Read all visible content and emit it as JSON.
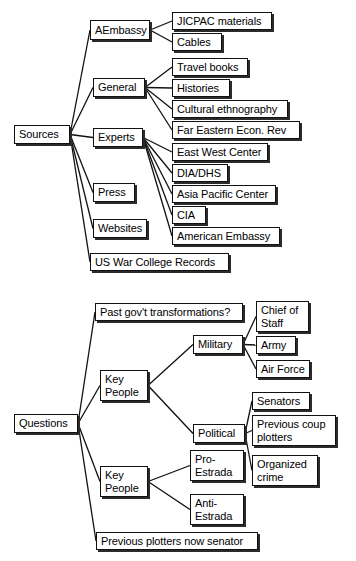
{
  "figure": {
    "diagrams": [
      {
        "id": "sources-map",
        "name": "sources-concept-map",
        "root": "Sources",
        "nodes": [
          {
            "id": "sources",
            "label": "Sources",
            "x": 14,
            "y": 125,
            "w": 56,
            "h": 19
          },
          {
            "id": "aembassy",
            "label": "AEmbassy",
            "x": 90,
            "y": 20,
            "w": 60,
            "h": 20
          },
          {
            "id": "jicpac",
            "label": "JICPAC materials",
            "x": 172,
            "y": 12,
            "w": 100,
            "h": 18
          },
          {
            "id": "cables",
            "label": "Cables",
            "x": 172,
            "y": 33,
            "w": 50,
            "h": 18
          },
          {
            "id": "general",
            "label": "General",
            "x": 93,
            "y": 78,
            "w": 52,
            "h": 19
          },
          {
            "id": "travelbooks",
            "label": "Travel books",
            "x": 172,
            "y": 58,
            "w": 76,
            "h": 18
          },
          {
            "id": "histories",
            "label": "Histories",
            "x": 172,
            "y": 79,
            "w": 58,
            "h": 18
          },
          {
            "id": "cultural",
            "label": "Cultural ethnography",
            "x": 172,
            "y": 100,
            "w": 116,
            "h": 18
          },
          {
            "id": "feer",
            "label": "Far  Eastern Econ. Rev",
            "x": 172,
            "y": 121,
            "w": 128,
            "h": 18
          },
          {
            "id": "experts",
            "label": "Experts",
            "x": 93,
            "y": 128,
            "w": 50,
            "h": 19
          },
          {
            "id": "ewc",
            "label": "East West Center",
            "x": 172,
            "y": 143,
            "w": 96,
            "h": 18
          },
          {
            "id": "diadhs",
            "label": "DIA/DHS",
            "x": 172,
            "y": 164,
            "w": 56,
            "h": 18
          },
          {
            "id": "apc",
            "label": "Asia Pacific Center",
            "x": 172,
            "y": 185,
            "w": 104,
            "h": 18
          },
          {
            "id": "cia",
            "label": "CIA",
            "x": 172,
            "y": 206,
            "w": 34,
            "h": 18
          },
          {
            "id": "amembassy",
            "label": "American Embassy",
            "x": 172,
            "y": 227,
            "w": 108,
            "h": 18
          },
          {
            "id": "press",
            "label": "Press",
            "x": 93,
            "y": 183,
            "w": 42,
            "h": 19
          },
          {
            "id": "websites",
            "label": "Websites",
            "x": 93,
            "y": 219,
            "w": 54,
            "h": 19
          },
          {
            "id": "uswc",
            "label": "US War College Records",
            "x": 90,
            "y": 253,
            "w": 139,
            "h": 18
          }
        ],
        "edges": [
          {
            "from": "sources",
            "to": "aembassy"
          },
          {
            "from": "sources",
            "to": "general"
          },
          {
            "from": "sources",
            "to": "experts"
          },
          {
            "from": "sources",
            "to": "press"
          },
          {
            "from": "sources",
            "to": "websites"
          },
          {
            "from": "sources",
            "to": "uswc"
          },
          {
            "from": "aembassy",
            "to": "jicpac"
          },
          {
            "from": "aembassy",
            "to": "cables"
          },
          {
            "from": "general",
            "to": "travelbooks"
          },
          {
            "from": "general",
            "to": "histories"
          },
          {
            "from": "general",
            "to": "cultural"
          },
          {
            "from": "general",
            "to": "feer"
          },
          {
            "from": "experts",
            "to": "ewc"
          },
          {
            "from": "experts",
            "to": "diadhs"
          },
          {
            "from": "experts",
            "to": "apc"
          },
          {
            "from": "experts",
            "to": "cia"
          },
          {
            "from": "experts",
            "to": "amembassy"
          }
        ]
      },
      {
        "id": "questions-map",
        "name": "questions-concept-map",
        "root": "Questions",
        "nodes": [
          {
            "id": "questions",
            "label": "Questions",
            "x": 14,
            "y": 414,
            "w": 64,
            "h": 19
          },
          {
            "id": "pastgov",
            "label": "Past gov't transformations?",
            "x": 95,
            "y": 303,
            "w": 148,
            "h": 18
          },
          {
            "id": "keypeople1",
            "label": "Key\nPeople",
            "x": 100,
            "y": 370,
            "w": 48,
            "h": 31
          },
          {
            "id": "military",
            "label": "Military",
            "x": 193,
            "y": 335,
            "w": 50,
            "h": 19
          },
          {
            "id": "chiefstaff",
            "label": "Chief of\nStaff",
            "x": 256,
            "y": 301,
            "w": 53,
            "h": 31
          },
          {
            "id": "army",
            "label": "Army",
            "x": 256,
            "y": 336,
            "w": 40,
            "h": 18
          },
          {
            "id": "airforce",
            "label": "Air Force",
            "x": 256,
            "y": 360,
            "w": 54,
            "h": 18
          },
          {
            "id": "political",
            "label": "Political",
            "x": 193,
            "y": 424,
            "w": 52,
            "h": 19
          },
          {
            "id": "senators",
            "label": "Senators",
            "x": 252,
            "y": 392,
            "w": 58,
            "h": 18
          },
          {
            "id": "prevcoup",
            "label": "Previous coup\nplotters",
            "x": 252,
            "y": 415,
            "w": 84,
            "h": 31
          },
          {
            "id": "orgcrime",
            "label": "Organized\ncrime",
            "x": 252,
            "y": 455,
            "w": 66,
            "h": 31
          },
          {
            "id": "keypeople2",
            "label": "Key\nPeople",
            "x": 100,
            "y": 466,
            "w": 48,
            "h": 31
          },
          {
            "id": "proestrada",
            "label": "Pro-\nEstrada",
            "x": 190,
            "y": 450,
            "w": 54,
            "h": 31
          },
          {
            "id": "antiestrada",
            "label": "Anti-\nEstrada",
            "x": 190,
            "y": 494,
            "w": 54,
            "h": 31
          },
          {
            "id": "prevplot",
            "label": "Previous plotters now senator",
            "x": 96,
            "y": 532,
            "w": 162,
            "h": 18
          }
        ],
        "edges": [
          {
            "from": "questions",
            "to": "pastgov"
          },
          {
            "from": "questions",
            "to": "keypeople1"
          },
          {
            "from": "questions",
            "to": "keypeople2"
          },
          {
            "from": "questions",
            "to": "prevplot"
          },
          {
            "from": "keypeople1",
            "to": "military"
          },
          {
            "from": "keypeople1",
            "to": "political"
          },
          {
            "from": "military",
            "to": "chiefstaff"
          },
          {
            "from": "military",
            "to": "army"
          },
          {
            "from": "military",
            "to": "airforce"
          },
          {
            "from": "political",
            "to": "senators"
          },
          {
            "from": "political",
            "to": "prevcoup"
          },
          {
            "from": "political",
            "to": "orgcrime"
          },
          {
            "from": "keypeople2",
            "to": "proestrada"
          },
          {
            "from": "keypeople2",
            "to": "antiestrada"
          }
        ]
      }
    ],
    "style": {
      "line_color": "#111111",
      "box_fill": "#ffffff",
      "box_border": "#111111",
      "shadow": "#2b2b2b",
      "background": "#ffffff"
    }
  }
}
